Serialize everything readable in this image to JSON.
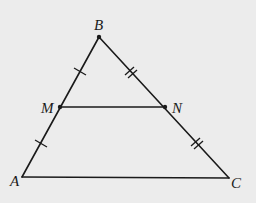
{
  "diagram": {
    "type": "triangle-midsegment",
    "background": "#ececec",
    "line_color": "#1a1a1a",
    "points": {
      "A": {
        "label": "A",
        "x": 22,
        "y": 177
      },
      "B": {
        "label": "B",
        "x": 99,
        "y": 37
      },
      "C": {
        "label": "C",
        "x": 229,
        "y": 178
      },
      "M": {
        "label": "M",
        "x": 60,
        "y": 107
      },
      "N": {
        "label": "N",
        "x": 165,
        "y": 107
      }
    },
    "segments": [
      "AB",
      "BC",
      "CA",
      "MN"
    ],
    "tick_marks": [
      {
        "segment": "BM",
        "count": 1
      },
      {
        "segment": "MA",
        "count": 1
      },
      {
        "segment": "BN",
        "count": 2
      },
      {
        "segment": "NC",
        "count": 2
      }
    ],
    "labels": {
      "A": "A",
      "B": "B",
      "C": "C",
      "M": "M",
      "N": "N"
    }
  }
}
